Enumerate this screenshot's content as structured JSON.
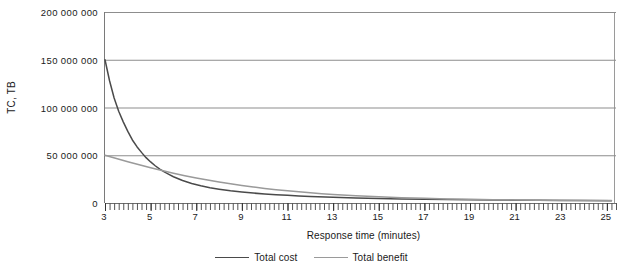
{
  "chart_data": {
    "type": "line",
    "title": "",
    "xlabel": "Response time (minutes)",
    "ylabel": "TC, TB",
    "xlim": [
      3,
      25.4
    ],
    "ylim": [
      0,
      200000000
    ],
    "grid": true,
    "legend_position": "bottom",
    "x_ticks": [
      3,
      5,
      7,
      9,
      11,
      13,
      15,
      17,
      19,
      21,
      23,
      25
    ],
    "x_tick_labels": [
      "3",
      "5",
      "7",
      "9",
      "11",
      "13",
      "15",
      "17",
      "19",
      "21",
      "23",
      "25"
    ],
    "x_minor_tick_step": 0.2,
    "y_ticks": [
      0,
      50000000,
      100000000,
      150000000,
      200000000
    ],
    "y_tick_labels": [
      "0",
      "50 000 000",
      "100 000 000",
      "150 000 000",
      "200 000 000"
    ],
    "series": [
      {
        "name": "Total cost",
        "color": "#4a4a4a",
        "x": [
          3,
          3.2,
          3.4,
          3.6,
          3.8,
          4,
          4.2,
          4.4,
          4.6,
          4.8,
          5,
          5.2,
          5.4,
          5.6,
          5.8,
          6,
          6.4,
          6.8,
          7.2,
          7.6,
          8,
          8.5,
          9,
          9.5,
          10,
          10.5,
          11,
          11.5,
          12,
          13,
          14,
          15,
          16,
          17,
          18,
          19,
          20,
          21,
          22,
          23,
          24,
          25.2
        ],
        "values": [
          150000000,
          128000000,
          110000000,
          96000000,
          85000000,
          75000000,
          66000000,
          59000000,
          53000000,
          47500000,
          43000000,
          39000000,
          35500000,
          32500000,
          30000000,
          27500000,
          23500000,
          20500000,
          18000000,
          16000000,
          14500000,
          12800000,
          11500000,
          10400000,
          9500000,
          8700000,
          8000000,
          7400000,
          6900000,
          6000000,
          5300000,
          4800000,
          4300000,
          4000000,
          3700000,
          3400000,
          3200000,
          3000000,
          2800000,
          2600000,
          2500000,
          2400000
        ]
      },
      {
        "name": "Total benefit",
        "color": "#9a9a9a",
        "x": [
          3,
          3.5,
          4,
          4.5,
          5,
          5.5,
          6,
          6.5,
          7,
          7.5,
          8,
          8.5,
          9,
          9.5,
          10,
          10.5,
          11,
          11.5,
          12,
          12.5,
          13,
          14,
          15,
          16,
          17,
          18,
          19,
          20,
          21,
          22,
          23,
          24,
          25.2
        ],
        "values": [
          50000000,
          46500000,
          43200000,
          40000000,
          37000000,
          34000000,
          31200000,
          28600000,
          26200000,
          24000000,
          22000000,
          20100000,
          18400000,
          16800000,
          15300000,
          14000000,
          12800000,
          11700000,
          10700000,
          9800000,
          9000000,
          7600000,
          6500000,
          5600000,
          4900000,
          4300000,
          3900000,
          3500000,
          3200000,
          3000000,
          2800000,
          2650000,
          2500000
        ]
      }
    ],
    "legend": [
      {
        "label": "Total cost",
        "color": "#4a4a4a"
      },
      {
        "label": "Total benefit",
        "color": "#9a9a9a"
      }
    ]
  },
  "colors": {
    "total_cost": "#4a4a4a",
    "total_benefit": "#9a9a9a",
    "gridline": "#8d8d8d",
    "axis": "#6f6f6f",
    "background": "#ffffff"
  }
}
